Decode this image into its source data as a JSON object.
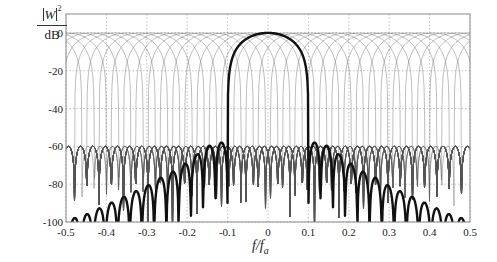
{
  "chart_data": {
    "type": "line",
    "title": "",
    "xlabel": "f/f_a",
    "xlabel_main": "f/f",
    "xlabel_sub": "a",
    "ylabel_num": "W",
    "ylabel_exp": "2",
    "ylabel_den": "dB",
    "xlim": [
      -0.5,
      0.5
    ],
    "ylim": [
      -100,
      10
    ],
    "xticks": [
      -0.5,
      -0.4,
      -0.3,
      -0.2,
      -0.1,
      0,
      0.1,
      0.2,
      0.3,
      0.4,
      0.5
    ],
    "xtick_labels": [
      "-0.5",
      "-0.4",
      "-0.3",
      "-0.2",
      "-0.1",
      "0",
      "0.1",
      "0.2",
      "0.3",
      "0.4",
      "0.5"
    ],
    "yticks": [
      0,
      -20,
      -40,
      -60,
      -80,
      -100
    ],
    "ytick_labels": [
      "0",
      "-20",
      "-40",
      "-60",
      "-80",
      "-100"
    ],
    "grid": true,
    "grid_style": "dotted",
    "legend": null,
    "series": [
      {
        "name": "window response (bold)",
        "style": "thick black",
        "mainlobe_peak_db": 0,
        "mainlobe_center": 0,
        "first_null": 0.1,
        "sidelobe_peaks": [
          {
            "x": 0.12,
            "y": -58
          },
          {
            "x": 0.15,
            "y": -60
          },
          {
            "x": 0.18,
            "y": -65
          },
          {
            "x": 0.21,
            "y": -70
          },
          {
            "x": 0.24,
            "y": -74
          },
          {
            "x": 0.27,
            "y": -77
          },
          {
            "x": 0.3,
            "y": -81
          },
          {
            "x": 0.33,
            "y": -84
          },
          {
            "x": 0.36,
            "y": -87
          },
          {
            "x": 0.39,
            "y": -90
          },
          {
            "x": 0.42,
            "y": -93
          },
          {
            "x": 0.45,
            "y": -96
          },
          {
            "x": 0.48,
            "y": -98
          }
        ],
        "symmetric": true
      },
      {
        "name": "filter bank channels (thin)",
        "style": "thin gray",
        "channel_spacing": 0.0303,
        "channel_count": 34,
        "peak_db": 0,
        "sidelobe_level_db": -60
      }
    ]
  },
  "colors": {
    "background": "#ffffff",
    "frame": "#8a8a8a",
    "grid": "#9a9a9a",
    "thin_curves": "#555555",
    "bold_curve": "#111111",
    "text": "#222222"
  }
}
